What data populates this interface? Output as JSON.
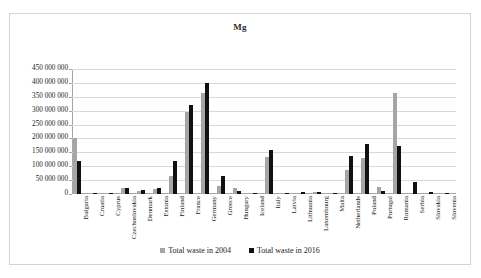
{
  "chart_data": {
    "type": "bar",
    "title": "Mg",
    "xlabel": "",
    "ylabel": "",
    "ylim": [
      0,
      450000000
    ],
    "ytick_step": 50000000,
    "ytick_labels": [
      "450 000 000",
      "400 000 000",
      "350 000 000",
      "300 000 000",
      "250 000 000",
      "200 000 000",
      "150 000 000",
      "100 000 000",
      "50 000 000",
      "0"
    ],
    "ytick_values": [
      450000000,
      400000000,
      350000000,
      300000000,
      250000000,
      200000000,
      150000000,
      100000000,
      50000000,
      0
    ],
    "grid": true,
    "legend_position": "bottom",
    "categories": [
      "Bulgaria",
      "Croatia",
      "Cyprus",
      "Czechoslovakia",
      "Denmark",
      "Estonia",
      "Finland",
      "France",
      "Germany",
      "Greece",
      "Hungary",
      "Iceland",
      "Italy",
      "Latvia",
      "Lithuania",
      "Luxembourg",
      "Malta",
      "Netherlands",
      "Poland",
      "Portugal",
      "Romania",
      "Serbia",
      "Slovakia",
      "Slovenia"
    ],
    "series": [
      {
        "name": "Total waste in 2004",
        "color": "#a6a6a6",
        "values": [
          200000000,
          3000000,
          2000000,
          23000000,
          11000000,
          19000000,
          66000000,
          295000000,
          362000000,
          30000000,
          20000000,
          500000,
          135000000,
          1000000,
          1500000,
          6000000,
          2000000,
          87000000,
          131000000,
          25000000,
          365000000,
          0,
          5000000,
          1000000
        ]
      },
      {
        "name": "Total waste in 2016",
        "color": "#111111",
        "values": [
          120000000,
          4000000,
          2500000,
          22000000,
          16000000,
          20000000,
          119000000,
          322000000,
          399000000,
          65000000,
          12000000,
          600000,
          158000000,
          2000000,
          5500000,
          8000000,
          3000000,
          137000000,
          180000000,
          11000000,
          172000000,
          44000000,
          7000000,
          4000000
        ]
      }
    ]
  },
  "legend": {
    "items": [
      {
        "label": "Total waste in 2004",
        "color": "#a6a6a6"
      },
      {
        "label": "Total waste in 2016",
        "color": "#111111"
      }
    ]
  }
}
